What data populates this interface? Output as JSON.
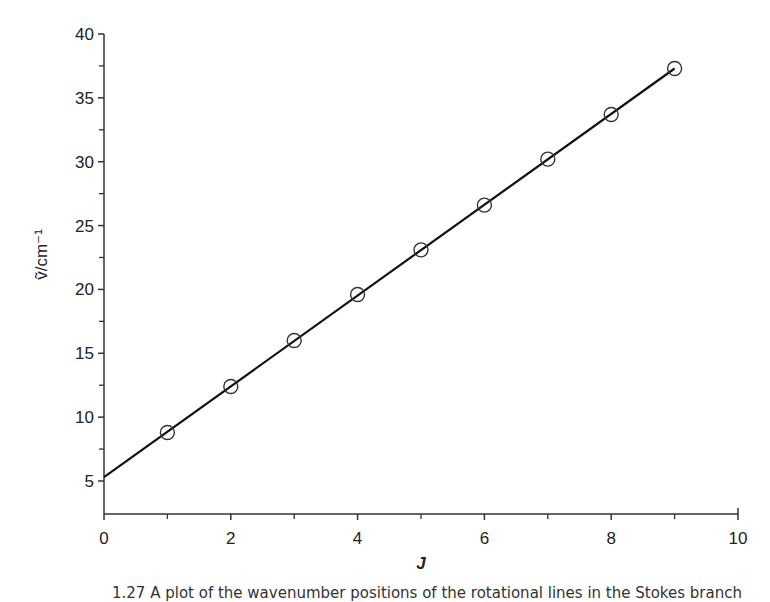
{
  "chart_data": {
    "type": "scatter",
    "title": "",
    "xlabel": "J",
    "ylabel": "ṽ/cm⁻¹",
    "xlim": [
      0,
      10
    ],
    "ylim": [
      2.5,
      40
    ],
    "x_ticks": [
      0,
      2,
      4,
      6,
      8,
      10
    ],
    "x_minor_ticks": [
      1,
      3,
      5,
      7,
      9
    ],
    "y_ticks": [
      5,
      10,
      15,
      20,
      25,
      30,
      35,
      40
    ],
    "y_minor_ticks": [
      7.5,
      12.5,
      17.5,
      22.5,
      27.5,
      32.5,
      37.5
    ],
    "grid": false,
    "legend": null,
    "series": [
      {
        "name": "observed",
        "marker": "open-circle",
        "x": [
          1,
          2,
          3,
          4,
          5,
          6,
          7,
          8,
          9
        ],
        "y": [
          8.8,
          12.4,
          16.0,
          19.6,
          23.1,
          26.6,
          30.2,
          33.7,
          37.3
        ]
      },
      {
        "name": "linear fit",
        "style": "line",
        "x": [
          0,
          9
        ],
        "y": [
          5.3,
          37.3
        ]
      }
    ]
  },
  "caption": "1.27 A plot of the wavenumber positions of the rotational lines in the Stokes branch",
  "colors": {
    "line": "#111111",
    "marker": "#333333",
    "axis": "#333333"
  }
}
